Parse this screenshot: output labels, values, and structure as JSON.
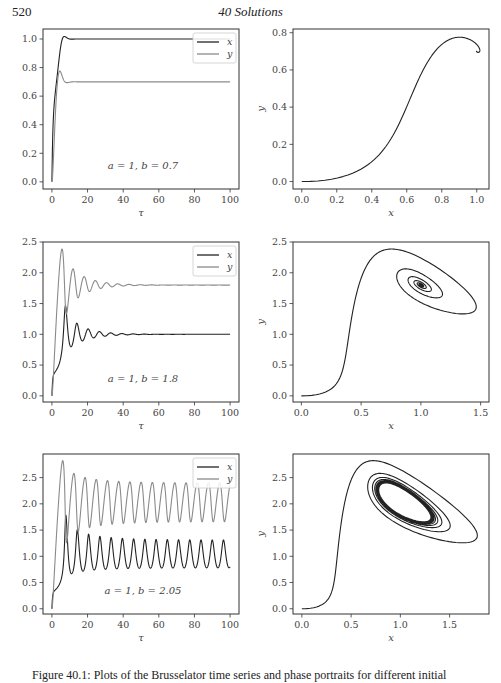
{
  "page": {
    "number": "520",
    "running_head": "40  Solutions",
    "caption": "Figure 40.1: Plots of the Brusselator time series and phase portraits for different initial"
  },
  "chart_data": [
    {
      "id": "ts1",
      "type": "line",
      "title": "",
      "annotation": "a = 1, b = 0.7",
      "xlabel": "τ",
      "ylabel": "",
      "xlim": [
        -5,
        105
      ],
      "ylim": [
        -0.05,
        1.07
      ],
      "xticks": [
        0,
        20,
        40,
        60,
        80,
        100
      ],
      "xtick_labels": [
        "0",
        "20",
        "40",
        "60",
        "80",
        "100"
      ],
      "yticks": [
        0.0,
        0.2,
        0.4,
        0.6,
        0.8,
        1.0
      ],
      "ytick_labels": [
        "0.0",
        "0.2",
        "0.4",
        "0.6",
        "0.8",
        "1.0"
      ],
      "legend": [
        "x",
        "y"
      ],
      "legend_position": "upper right",
      "series": [
        {
          "name": "x",
          "color": "#222222",
          "x": [
            0,
            1,
            2,
            3,
            4,
            5,
            6,
            7,
            8,
            10,
            15,
            20,
            40,
            60,
            80,
            100
          ],
          "y": [
            0.0,
            0.35,
            0.62,
            0.82,
            0.95,
            1.01,
            1.02,
            1.01,
            1.0,
            1.0,
            1.0,
            1.0,
            1.0,
            1.0,
            1.0,
            1.0
          ]
        },
        {
          "name": "y",
          "color": "#8a8a8a",
          "x": [
            0,
            1,
            2,
            3,
            4,
            5,
            6,
            7,
            8,
            10,
            15,
            20,
            40,
            60,
            80,
            100
          ],
          "y": [
            0.0,
            0.4,
            0.6,
            0.72,
            0.77,
            0.76,
            0.72,
            0.7,
            0.7,
            0.7,
            0.7,
            0.7,
            0.7,
            0.7,
            0.7,
            0.7
          ]
        }
      ]
    },
    {
      "id": "pp1",
      "type": "line",
      "title": "",
      "xlabel": "x",
      "ylabel": "y",
      "xlim": [
        -0.05,
        1.07
      ],
      "ylim": [
        -0.04,
        0.82
      ],
      "xticks": [
        0.0,
        0.2,
        0.4,
        0.6,
        0.8,
        1.0
      ],
      "xtick_labels": [
        "0.0",
        "0.2",
        "0.4",
        "0.6",
        "0.8",
        "1.0"
      ],
      "yticks": [
        0.0,
        0.2,
        0.4,
        0.6,
        0.8
      ],
      "ytick_labels": [
        "0.0",
        "0.2",
        "0.4",
        "0.6",
        "0.8"
      ],
      "series": [
        {
          "name": "trajectory",
          "color": "#222222",
          "x": [
            0.0,
            0.1,
            0.2,
            0.3,
            0.4,
            0.5,
            0.6,
            0.65,
            0.7,
            0.8,
            0.9,
            0.97,
            1.01,
            1.02,
            1.0,
            1.01
          ],
          "y": [
            0.0,
            0.003,
            0.02,
            0.05,
            0.11,
            0.22,
            0.4,
            0.5,
            0.6,
            0.72,
            0.77,
            0.76,
            0.73,
            0.7,
            0.71,
            0.7
          ]
        }
      ]
    },
    {
      "id": "ts2",
      "type": "line",
      "title": "",
      "annotation": "a = 1, b = 1.8",
      "xlabel": "τ",
      "ylabel": "",
      "xlim": [
        -5,
        105
      ],
      "ylim": [
        -0.1,
        2.5
      ],
      "xticks": [
        0,
        20,
        40,
        60,
        80,
        100
      ],
      "xtick_labels": [
        "0",
        "20",
        "40",
        "60",
        "80",
        "100"
      ],
      "yticks": [
        0.0,
        0.5,
        1.0,
        1.5,
        2.0,
        2.5
      ],
      "ytick_labels": [
        "0.0",
        "0.5",
        "1.0",
        "1.5",
        "2.0",
        "2.5"
      ],
      "legend": [
        "x",
        "y"
      ],
      "legend_position": "upper right",
      "series": [
        {
          "name": "x",
          "color": "#222222",
          "x": [
            0,
            1,
            3,
            5,
            7,
            8,
            10,
            12,
            14,
            16,
            18,
            20,
            22,
            24,
            26,
            28,
            30,
            35,
            40,
            50,
            60,
            80,
            100
          ],
          "y": [
            0.0,
            0.35,
            0.45,
            0.6,
            1.2,
            1.45,
            0.85,
            0.82,
            1.18,
            0.92,
            0.92,
            1.08,
            0.95,
            0.96,
            1.04,
            0.97,
            1.0,
            0.99,
            1.0,
            1.0,
            1.0,
            1.0,
            1.0
          ]
        },
        {
          "name": "y",
          "color": "#8a8a8a",
          "x": [
            0,
            1,
            3,
            5,
            6,
            7,
            8,
            10,
            12,
            14,
            16,
            18,
            20,
            22,
            24,
            26,
            28,
            30,
            35,
            40,
            50,
            60,
            80,
            100
          ],
          "y": [
            0.0,
            0.4,
            1.4,
            2.3,
            2.38,
            2.2,
            1.8,
            1.7,
            2.06,
            1.6,
            1.75,
            1.93,
            1.72,
            1.76,
            1.87,
            1.75,
            1.78,
            1.82,
            1.78,
            1.8,
            1.8,
            1.8,
            1.8,
            1.8
          ]
        }
      ]
    },
    {
      "id": "pp2",
      "type": "line",
      "title": "",
      "xlabel": "x",
      "ylabel": "y",
      "xlim": [
        -0.07,
        1.57
      ],
      "ylim": [
        -0.1,
        2.5
      ],
      "xticks": [
        0.0,
        0.5,
        1.0,
        1.5
      ],
      "xtick_labels": [
        "0.0",
        "0.5",
        "1.0",
        "1.5"
      ],
      "yticks": [
        0.0,
        0.5,
        1.0,
        1.5,
        2.0,
        2.5
      ],
      "ytick_labels": [
        "0.0",
        "0.5",
        "1.0",
        "1.5",
        "2.0",
        "2.5"
      ],
      "series": [
        {
          "name": "trajectory",
          "color": "#222222",
          "note": "spiral converging to fixed point (1.0, 1.8)"
        }
      ]
    },
    {
      "id": "ts3",
      "type": "line",
      "title": "",
      "annotation": "a = 1, b = 2.05",
      "xlabel": "τ",
      "ylabel": "",
      "xlim": [
        -5,
        105
      ],
      "ylim": [
        -0.1,
        2.95
      ],
      "xticks": [
        0,
        20,
        40,
        60,
        80,
        100
      ],
      "xtick_labels": [
        "0",
        "20",
        "40",
        "60",
        "80",
        "100"
      ],
      "yticks": [
        0.0,
        0.5,
        1.0,
        1.5,
        2.0,
        2.5
      ],
      "ytick_labels": [
        "0.0",
        "0.5",
        "1.0",
        "1.5",
        "2.0",
        "2.5"
      ],
      "legend": [
        "x",
        "y"
      ],
      "legend_position": "upper right",
      "series": [
        {
          "name": "x",
          "color": "#222222",
          "note": "oscillates ~0.75–1.35 with period ~6.5 after initial transient peak 1.8 at τ≈8"
        },
        {
          "name": "y",
          "color": "#8a8a8a",
          "note": "oscillates ~1.6–2.45 with period ~6.5 after initial peak 2.82 at τ≈6"
        }
      ]
    },
    {
      "id": "pp3",
      "type": "line",
      "title": "",
      "xlabel": "x",
      "ylabel": "y",
      "xlim": [
        -0.09,
        1.9
      ],
      "ylim": [
        -0.1,
        2.95
      ],
      "xticks": [
        0.0,
        0.5,
        1.0,
        1.5
      ],
      "xtick_labels": [
        "0.0",
        "0.5",
        "1.0",
        "1.5"
      ],
      "yticks": [
        0.0,
        0.5,
        1.0,
        1.5,
        2.0,
        2.5
      ],
      "ytick_labels": [
        "0.0",
        "0.5",
        "1.0",
        "1.5",
        "2.0",
        "2.5"
      ],
      "series": [
        {
          "name": "trajectory",
          "color": "#222222",
          "note": "spiral converging to limit cycle centered near (1.05, 1.95)"
        }
      ]
    }
  ]
}
